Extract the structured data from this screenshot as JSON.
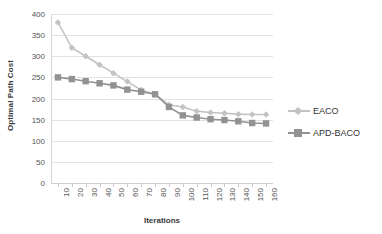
{
  "chart_data": {
    "type": "line",
    "title": "",
    "xlabel": "Iterations",
    "ylabel": "Optimal Path Cost",
    "x": [
      10,
      20,
      30,
      40,
      50,
      60,
      70,
      80,
      90,
      100,
      110,
      120,
      130,
      140,
      150,
      160
    ],
    "xtick_labels": [
      "10",
      "20",
      "30",
      "40",
      "50",
      "60",
      "70",
      "80",
      "90",
      "100",
      "110",
      "120",
      "130",
      "140",
      "150",
      "160"
    ],
    "ytick_labels": [
      "0",
      "50",
      "100",
      "150",
      "200",
      "250",
      "300",
      "350",
      "400"
    ],
    "yticks": [
      0,
      50,
      100,
      150,
      200,
      250,
      300,
      350,
      400
    ],
    "ylim": [
      0,
      400
    ],
    "grid": true,
    "legend_position": "right",
    "series": [
      {
        "name": "EACO",
        "color": "#c3c3c3",
        "marker": "diamond",
        "values": [
          380,
          320,
          300,
          280,
          260,
          240,
          220,
          210,
          185,
          180,
          170,
          167,
          165,
          163,
          162,
          162
        ]
      },
      {
        "name": "APD-BACO",
        "color": "#929292",
        "marker": "square",
        "values": [
          250,
          246,
          241,
          236,
          231,
          221,
          216,
          210,
          180,
          160,
          155,
          151,
          149,
          146,
          142,
          141
        ]
      }
    ]
  },
  "legend": {
    "items": [
      {
        "label": "EACO"
      },
      {
        "label": "APD-BACO"
      }
    ]
  },
  "colors": {
    "background": "#ffffff",
    "gridline": "#e2e2e2",
    "axis": "#d4d4d4",
    "tick_text": "#555555",
    "title_text": "#3a3a3a",
    "series_eaco": "#c3c3c3",
    "series_apd_baco": "#929292"
  }
}
